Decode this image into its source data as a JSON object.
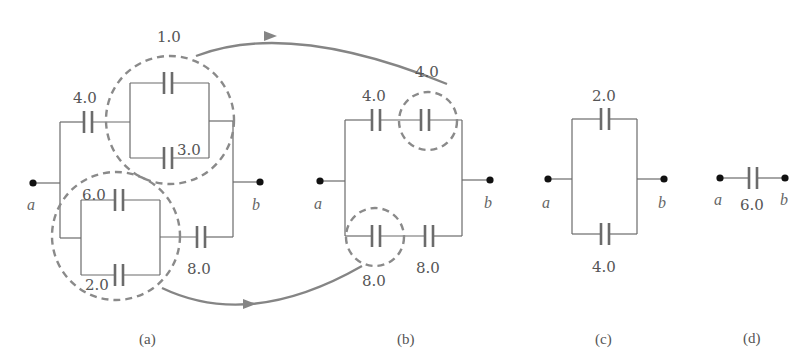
{
  "figure": {
    "panels": [
      {
        "id": "a",
        "caption": "(a)",
        "terminals": {
          "left": "a",
          "right": "b"
        },
        "capacitors": {
          "top_series": "4.0",
          "upper_parallel_top": "1.0",
          "upper_parallel_bottom": "3.0",
          "lower_parallel_top": "6.0",
          "lower_parallel_bottom": "2.0",
          "lower_series": "8.0"
        }
      },
      {
        "id": "b",
        "caption": "(b)",
        "terminals": {
          "left": "a",
          "right": "b"
        },
        "capacitors": {
          "top_left": "4.0",
          "top_right_combined": "4.0",
          "bottom_left_combined": "8.0",
          "bottom_right": "8.0"
        }
      },
      {
        "id": "c",
        "caption": "(c)",
        "terminals": {
          "left": "a",
          "right": "b"
        },
        "capacitors": {
          "top": "2.0",
          "bottom": "4.0"
        }
      },
      {
        "id": "d",
        "caption": "(d)",
        "terminals": {
          "left": "a",
          "right": "b"
        },
        "capacitors": {
          "equivalent": "6.0"
        }
      }
    ],
    "colors": {
      "wire": "#6b6b6b",
      "dashed_circle": "#8a8a8a",
      "arrow": "#858585",
      "terminal_dot": "#111111"
    }
  }
}
